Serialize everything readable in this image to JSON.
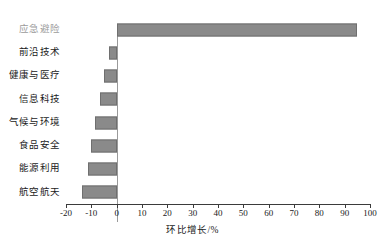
{
  "chart_data": {
    "type": "bar",
    "orientation": "horizontal",
    "title": "",
    "xlabel": "环比增长/%",
    "ylabel": "",
    "xlim": [
      -20,
      100
    ],
    "xticks": [
      -20,
      -10,
      0,
      10,
      20,
      30,
      40,
      50,
      60,
      70,
      80,
      90,
      100
    ],
    "xtick_labels": [
      "-20",
      "-10",
      "0",
      "10",
      "20",
      "30",
      "40",
      "50",
      "60",
      "70",
      "80",
      "90",
      "100"
    ],
    "grid": false,
    "legend": null,
    "bar_color": "#8a8a8a",
    "bar_edge_color": "#6f6f6f",
    "categories": [
      "应急避险",
      "前沿技术",
      "健康与医疗",
      "信息科技",
      "气候与环境",
      "食品安全",
      "能源利用",
      "航空航天"
    ],
    "values": [
      95,
      -3,
      -5,
      -6.5,
      -8.5,
      -10,
      -11.5,
      -13.5
    ],
    "category_label_colors": [
      "#9b9b9b",
      "#1a1a1a",
      "#1a1a1a",
      "#1a1a1a",
      "#1a1a1a",
      "#1a1a1a",
      "#1a1a1a",
      "#1a1a1a"
    ]
  }
}
